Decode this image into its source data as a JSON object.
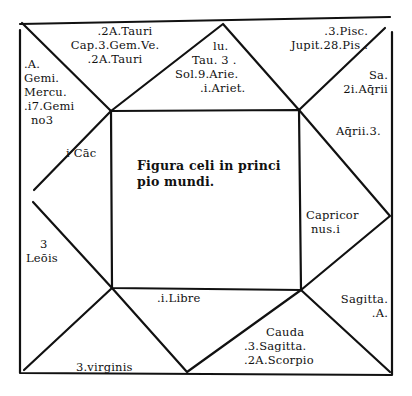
{
  "diagram": {
    "title_lines": [
      "Figura celi in princi",
      "pio mundi."
    ],
    "houses": {
      "top_left_triangle": [
        ".2A.Tauri",
        "Cap.3.Gem.Ve.",
        ".2A.Tauri"
      ],
      "top_center_triangle": [
        "lu.",
        "Tau. 3 .",
        "Sol.9.Arie.",
        ".i.Ariet."
      ],
      "top_right_triangle": [
        ".3.Pisc.",
        "Jupit.28.Pis ."
      ],
      "left_upper_corner": [
        ".A.",
        "Gemi.",
        "Mercu.",
        ".i7.Gemi",
        "no3"
      ],
      "left_upper_inner": [
        "i Cāc"
      ],
      "right_upper_corner": [
        "Sa.",
        "2i.Aq̄rii"
      ],
      "right_upper_inner": [
        "Aq̄rii.3."
      ],
      "left_center_triangle": [
        "3",
        "Leōis"
      ],
      "right_center_triangle": [
        "Capricor",
        "nus.i"
      ],
      "bottom_center_triangle": [
        ".i.Libre"
      ],
      "bottom_left_triangle": [
        "3.virginis"
      ],
      "bottom_right_triangle": [
        "Cauda",
        ".3.Sagitta.",
        ".2A.Scorpio"
      ],
      "right_lower_corner": [
        "Sagitta.",
        ".A."
      ]
    },
    "line_color": "#111111",
    "background": "#ffffff"
  }
}
